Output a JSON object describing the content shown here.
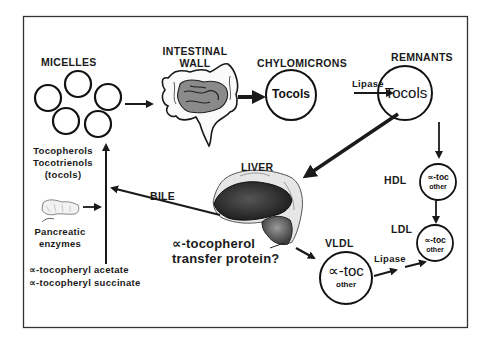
{
  "diagram": {
    "title_nodes": {
      "micelles": "MICELLES",
      "intestinal_wall_line1": "INTESTINAL",
      "intestinal_wall_line2": "WALL",
      "chylomicrons": "CHYLOMICRONS",
      "remnants": "REMNANTS",
      "liver": "LIVER",
      "hdl": "HDL",
      "ldl": "LDL",
      "vldl": "VLDL"
    },
    "circle_contents": {
      "chylomicrons": "Tocols",
      "remnants": "Tocols",
      "hdl_main": "∝-toc",
      "hdl_sub": "other",
      "ldl_main": "∝-toc",
      "ldl_sub": "other",
      "vldl_main": "∝-toc",
      "vldl_sub": "other"
    },
    "edge_labels": {
      "chylo_to_remnants": "Lipase",
      "vldl_to_ldl": "Lipase",
      "liver_to_intestine": "BILE"
    },
    "side_notes": {
      "tocols_line1": "Tocopherols",
      "tocols_line2": "Tocotrienols",
      "tocols_line3": "(tocols)",
      "pancreatic_line1": "Pancreatic",
      "pancreatic_line2": "enzymes",
      "ester1": "∝-tocopheryl acetate",
      "ester2": "∝-tocopheryl succinate",
      "transfer_line1": "∝-tocopherol",
      "transfer_line2": "transfer protein?"
    },
    "icons": [
      "micelle-circles",
      "intestine-illustration",
      "liver-illustration",
      "pancreas-illustration",
      "arrow"
    ],
    "colors": {
      "ink": "#1a1a1a",
      "organ_fill": "#8a8a8a",
      "liver_dark": "#2b2b2b",
      "background": "#ffffff"
    }
  }
}
